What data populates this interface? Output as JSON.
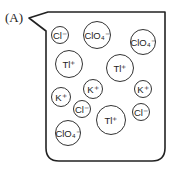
{
  "diagram": {
    "label": "(A)",
    "ions": [
      {
        "text": "Cl⁻",
        "x": 60,
        "y": 35,
        "r": 9
      },
      {
        "text": "ClO₄⁻",
        "x": 97,
        "y": 35,
        "r": 14
      },
      {
        "text": "ClO₄⁻",
        "x": 143,
        "y": 42,
        "r": 13
      },
      {
        "text": "Tl⁺",
        "x": 69,
        "y": 64,
        "r": 14
      },
      {
        "text": "Tl⁺",
        "x": 120,
        "y": 68,
        "r": 14
      },
      {
        "text": "K⁺",
        "x": 93,
        "y": 89,
        "r": 10
      },
      {
        "text": "K⁺",
        "x": 143,
        "y": 89,
        "r": 9
      },
      {
        "text": "K⁺",
        "x": 61,
        "y": 97,
        "r": 10
      },
      {
        "text": "Cl⁻",
        "x": 82,
        "y": 109,
        "r": 9
      },
      {
        "text": "Tl⁺",
        "x": 111,
        "y": 120,
        "r": 15
      },
      {
        "text": "Cl⁻",
        "x": 141,
        "y": 112,
        "r": 9
      },
      {
        "text": "ClO₄⁻",
        "x": 68,
        "y": 133,
        "r": 13
      }
    ]
  }
}
